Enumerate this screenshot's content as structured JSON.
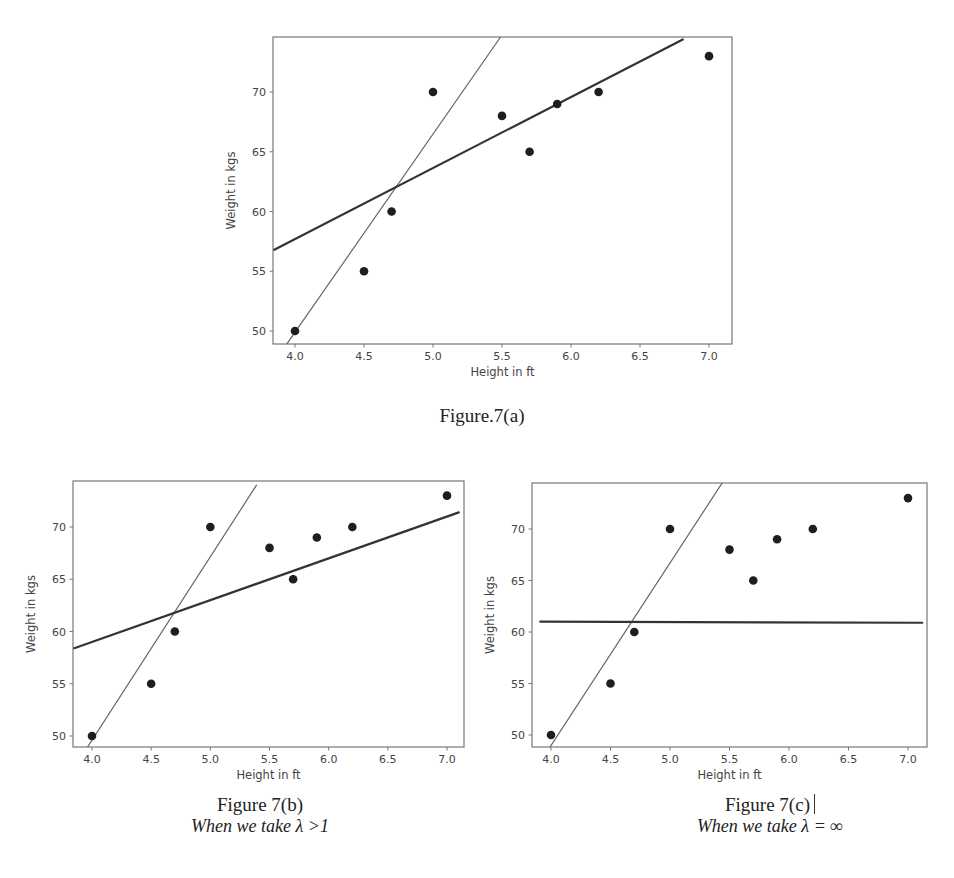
{
  "figures": [
    {
      "id": "a",
      "caption": "Figure.7(a)",
      "subcaption": "",
      "frame": {
        "left": 273,
        "top": 37,
        "right": 732,
        "bottom": 344
      },
      "xmap": {
        "v0": 4.0,
        "p0": 295,
        "v1": 7.0,
        "p1": 709
      },
      "ymap": {
        "v0": 50,
        "p0": 331,
        "v1": 70,
        "p1": 92
      }
    },
    {
      "id": "b",
      "caption": "Figure 7(b)",
      "subcaption": "When we take λ >1",
      "frame": {
        "left": 73,
        "top": 481,
        "right": 464,
        "bottom": 747
      },
      "xmap": {
        "v0": 4.0,
        "p0": 92,
        "v1": 7.0,
        "p1": 447
      },
      "ymap": {
        "v0": 50,
        "p0": 736,
        "v1": 70,
        "p1": 527
      }
    },
    {
      "id": "c",
      "caption": "Figure 7(c)",
      "subcaption": "When we take λ = ∞",
      "frame": {
        "left": 532,
        "top": 483,
        "right": 927,
        "bottom": 747
      },
      "xmap": {
        "v0": 4.0,
        "p0": 551,
        "v1": 7.0,
        "p1": 908
      },
      "ymap": {
        "v0": 50,
        "p0": 735,
        "v1": 70,
        "p1": 529
      }
    }
  ],
  "chart_data": [
    {
      "type": "scatter",
      "title": "Figure.7(a)",
      "xlabel": "Height in ft",
      "ylabel": "Weight in kgs",
      "xlim": [
        3.85,
        7.08
      ],
      "ylim": [
        48.9,
        74.6
      ],
      "xticks": [
        "4.0",
        "4.5",
        "5.0",
        "5.5",
        "6.0",
        "6.5",
        "7.0"
      ],
      "yticks": [
        "50",
        "55",
        "60",
        "65",
        "70"
      ],
      "grid": false,
      "series": [
        {
          "name": "data points",
          "type": "scatter",
          "x": [
            4.0,
            4.5,
            4.7,
            5.0,
            5.5,
            5.7,
            5.9,
            6.2,
            7.0
          ],
          "y": [
            50,
            55,
            60,
            70,
            68,
            65,
            69,
            70,
            73
          ]
        },
        {
          "name": "steep fit line (thin)",
          "type": "line",
          "x": [
            3.94,
            5.49
          ],
          "y": [
            48.9,
            74.6
          ],
          "width": 1.2,
          "color": "#666666"
        },
        {
          "name": "ridge fit line (thick)",
          "type": "line",
          "x": [
            3.85,
            6.81
          ],
          "y": [
            56.8,
            74.4
          ],
          "width": 2.2,
          "color": "#333333"
        }
      ]
    },
    {
      "type": "scatter",
      "title": "Figure 7(b)",
      "subtitle": "When we take λ >1",
      "xlabel": "Height in ft",
      "ylabel": "Weight in kgs",
      "xlim": [
        3.85,
        7.1
      ],
      "ylim": [
        48.9,
        74.3
      ],
      "xticks": [
        "4.0",
        "4.5",
        "5.0",
        "5.5",
        "6.0",
        "6.5",
        "7.0"
      ],
      "yticks": [
        "50",
        "55",
        "60",
        "65",
        "70"
      ],
      "grid": false,
      "series": [
        {
          "name": "data points",
          "type": "scatter",
          "x": [
            4.0,
            4.5,
            4.7,
            5.0,
            5.5,
            5.7,
            5.9,
            6.2,
            7.0
          ],
          "y": [
            50,
            55,
            60,
            70,
            68,
            65,
            69,
            70,
            73
          ]
        },
        {
          "name": "steep fit line (thin)",
          "type": "line",
          "x": [
            3.96,
            5.39
          ],
          "y": [
            48.9,
            74.0
          ],
          "width": 1.2,
          "color": "#666666"
        },
        {
          "name": "ridge fit line (thick)",
          "type": "line",
          "x": [
            3.85,
            7.1
          ],
          "y": [
            58.4,
            71.4
          ],
          "width": 2.2,
          "color": "#333333"
        }
      ]
    },
    {
      "type": "scatter",
      "title": "Figure 7(c)",
      "subtitle": "When we take λ = ∞",
      "xlabel": "Height in ft",
      "ylabel": "Weight in kgs",
      "xlim": [
        3.85,
        7.16
      ],
      "ylim": [
        48.8,
        74.5
      ],
      "xticks": [
        "4.0",
        "4.5",
        "5.0",
        "5.5",
        "6.0",
        "6.5",
        "7.0"
      ],
      "yticks": [
        "50",
        "55",
        "60",
        "65",
        "70"
      ],
      "grid": false,
      "series": [
        {
          "name": "data points",
          "type": "scatter",
          "x": [
            4.0,
            4.5,
            4.7,
            5.0,
            5.5,
            5.7,
            5.9,
            6.2,
            7.0
          ],
          "y": [
            50,
            55,
            60,
            70,
            68,
            65,
            69,
            70,
            73
          ]
        },
        {
          "name": "steep fit line (thin)",
          "type": "line",
          "x": [
            3.99,
            5.44
          ],
          "y": [
            48.8,
            74.5
          ],
          "width": 1.2,
          "color": "#666666"
        },
        {
          "name": "ridge fit line (thick, horizontal)",
          "type": "line",
          "x": [
            3.91,
            7.12
          ],
          "y": [
            61.0,
            60.9
          ],
          "width": 2.2,
          "color": "#333333"
        }
      ]
    }
  ],
  "style": {
    "point_color": "#1e1e1e",
    "axis_color": "#777777",
    "text_color": "#444444"
  }
}
